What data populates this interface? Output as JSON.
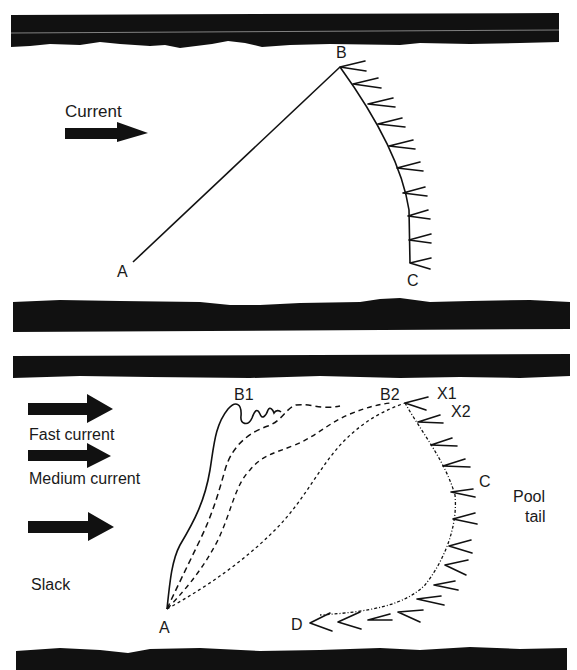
{
  "panels": [
    {
      "id": "top",
      "current_label": "Current",
      "points": {
        "A": "A",
        "B": "B",
        "C": "C"
      }
    },
    {
      "id": "bottom",
      "flow_labels": [
        "Fast current",
        "Medium current",
        "Slack"
      ],
      "points": {
        "A": "A",
        "B1": "B1",
        "B2": "B2",
        "X1": "X1",
        "X2": "X2",
        "C": "C",
        "D": "D"
      },
      "pool_tail_label": [
        "Pool",
        "tail"
      ]
    }
  ],
  "colors": {
    "ink": "#111111",
    "paper": "#ffffff"
  }
}
